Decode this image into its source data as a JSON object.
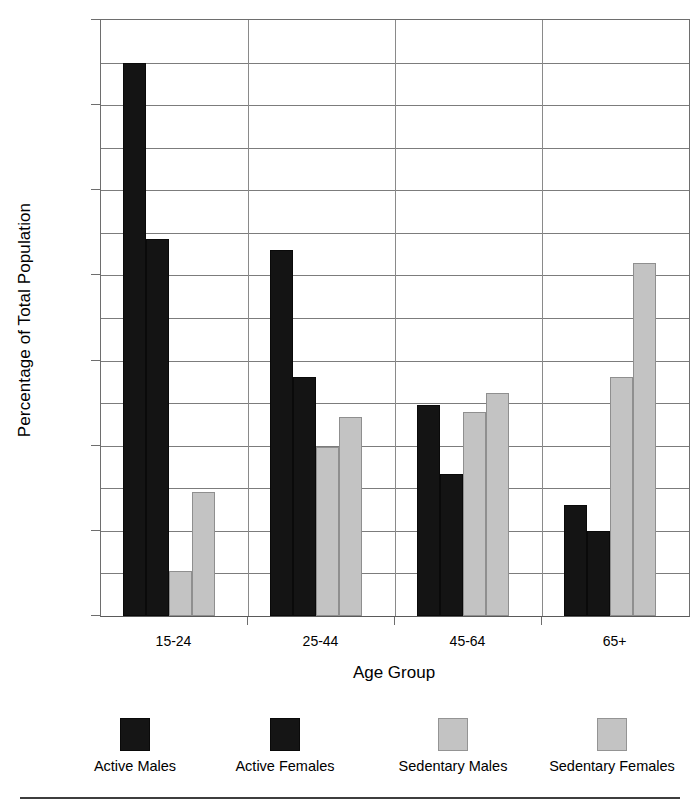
{
  "chart_data": {
    "type": "bar",
    "title": "",
    "xlabel": "Age Group",
    "ylabel": "Percentage of Total Population",
    "categories": [
      "15-24",
      "25-44",
      "45-64",
      "65+"
    ],
    "series": [
      {
        "name": "Active Males",
        "color": "#141414",
        "values": [
          65.0,
          43.0,
          24.8,
          13.0
        ]
      },
      {
        "name": "Active Females",
        "color": "#141414",
        "values": [
          44.3,
          28.1,
          16.7,
          10.0
        ]
      },
      {
        "name": "Sedentary Males",
        "color": "#c3c3c3",
        "values": [
          5.3,
          19.9,
          24.0,
          28.1
        ]
      },
      {
        "name": "Sedentary Females",
        "color": "#c3c3c3",
        "values": [
          14.6,
          23.4,
          26.2,
          41.5
        ]
      }
    ],
    "ylim": [
      0,
      70
    ],
    "yticks": [
      0,
      10,
      20,
      30,
      40,
      50,
      60,
      70
    ],
    "yticklabels": [
      "0",
      "10",
      "20",
      "30",
      "40",
      "50",
      "60",
      "70"
    ],
    "minor_gridline_step": 5,
    "grid": true,
    "legend_position": "bottom"
  },
  "axis": {
    "y_title": "Percentage of Total Population",
    "x_title": "Age Group",
    "y_tick_labels": [
      "70",
      "60",
      "50",
      "40",
      "30",
      "20",
      "10",
      "0"
    ],
    "x_tick_labels": [
      "15-24",
      "25-44",
      "45-64",
      "65+"
    ]
  },
  "legend": {
    "items": [
      {
        "label": "Active Males",
        "swatch": "dark-square-icon"
      },
      {
        "label": "Active Females",
        "swatch": "dark-square-icon"
      },
      {
        "label": "Sedentary Males",
        "swatch": "light-square-icon"
      },
      {
        "label": "Sedentary Females",
        "swatch": "light-square-icon"
      }
    ]
  }
}
